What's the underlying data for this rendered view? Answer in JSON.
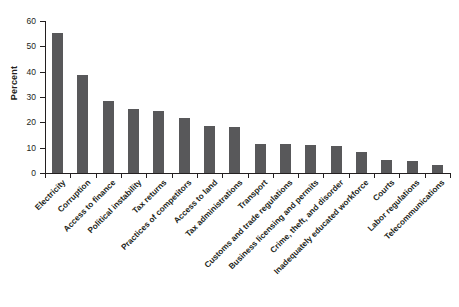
{
  "title_fragment": "",
  "source_note": "",
  "chart_data": {
    "type": "bar",
    "title": "",
    "xlabel": "",
    "ylabel": "Percent",
    "ylim": [
      0,
      60
    ],
    "ytick_values": [
      0,
      10,
      20,
      30,
      40,
      50,
      60
    ],
    "ytick_labels": [
      "0",
      "10",
      "20",
      "30",
      "40",
      "50",
      "60"
    ],
    "grid": false,
    "legend": false,
    "bar_color": "#58585a",
    "axis_color": "#231f20",
    "categories": [
      "Electricity",
      "Corruption",
      "Access to finance",
      "Political instability",
      "Tax returns",
      "Practices of competitors",
      "Access to land",
      "Tax administrations",
      "Transport",
      "Customs and trade regulations",
      "Business licensing and permits",
      "Crime, theft, and disorder",
      "Inadequately educated workforce",
      "Courts",
      "Labor regulations",
      "Telecommunications"
    ],
    "values": [
      55.3,
      38.7,
      28.5,
      25.3,
      24.5,
      21.7,
      18.6,
      18.2,
      11.5,
      11.5,
      11.1,
      10.7,
      8.3,
      5.2,
      4.6,
      3.2
    ]
  }
}
